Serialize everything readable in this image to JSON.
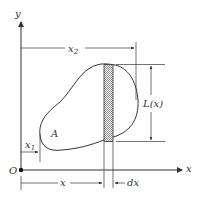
{
  "diagram": {
    "axes": {
      "y_label": "y",
      "x_label": "x",
      "origin_label": "O"
    },
    "region_label": "A",
    "dimensions": {
      "x1": "x",
      "x1_sub": "1",
      "x2": "x",
      "x2_sub": "2",
      "x": "x",
      "dx": "dx",
      "Lx": "L(x)"
    },
    "colors": {
      "stroke": "#333333",
      "strip_fill": "#bdbdbd"
    }
  }
}
